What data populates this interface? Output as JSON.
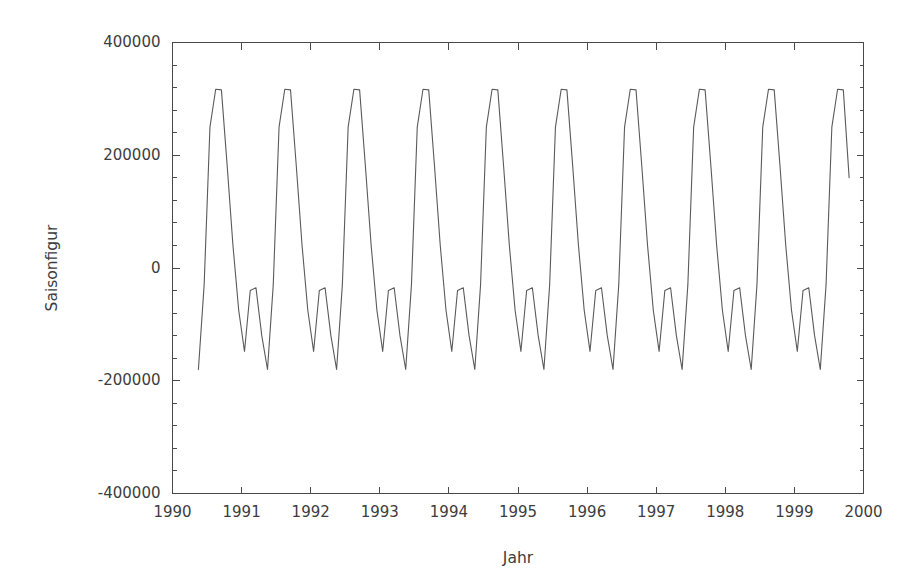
{
  "chart_data": {
    "type": "line",
    "title": "",
    "subtitle": "",
    "xlabel": "Jahr",
    "ylabel": "Saisonfigur",
    "xlim": [
      1990.0,
      2000.0
    ],
    "ylim": [
      -400000,
      400000
    ],
    "xticks": [
      1990,
      1991,
      1992,
      1993,
      1994,
      1995,
      1996,
      1997,
      1998,
      1999,
      2000
    ],
    "xtick_labels": [
      "1990",
      "1991",
      "1992",
      "1993",
      "1994",
      "1995",
      "1996",
      "1997",
      "1998",
      "1999",
      "2000"
    ],
    "yticks": [
      -400000,
      -200000,
      0,
      200000,
      400000
    ],
    "ytick_labels": [
      "-400000",
      "-200000",
      "0",
      "200000",
      "400000"
    ],
    "minor_ticks_per_interval_y": 4,
    "grid": false,
    "legend": null,
    "legend_position": "none",
    "line_color": "#5a5a5a",
    "axis_color": "#4a4a4a",
    "background_color": "#ffffff",
    "series": [
      {
        "name": "Saisonfigur",
        "x": [
          1990.375,
          1990.458,
          1990.542,
          1990.625,
          1990.708,
          1990.792,
          1990.875,
          1990.958,
          1991.042,
          1991.125,
          1991.208,
          1991.292,
          1991.375,
          1991.458,
          1991.542,
          1991.625,
          1991.708,
          1991.792,
          1991.875,
          1991.958,
          1992.042,
          1992.125,
          1992.208,
          1992.292,
          1992.375,
          1992.458,
          1992.542,
          1992.625,
          1992.708,
          1992.792,
          1992.875,
          1992.958,
          1993.042,
          1993.125,
          1993.208,
          1993.292,
          1993.375,
          1993.458,
          1993.542,
          1993.625,
          1993.708,
          1993.792,
          1993.875,
          1993.958,
          1994.042,
          1994.125,
          1994.208,
          1994.292,
          1994.375,
          1994.458,
          1994.542,
          1994.625,
          1994.708,
          1994.792,
          1994.875,
          1994.958,
          1995.042,
          1995.125,
          1995.208,
          1995.292,
          1995.375,
          1995.458,
          1995.542,
          1995.625,
          1995.708,
          1995.792,
          1995.875,
          1995.958,
          1996.042,
          1996.125,
          1996.208,
          1996.292,
          1996.375,
          1996.458,
          1996.542,
          1996.625,
          1996.708,
          1996.792,
          1996.875,
          1996.958,
          1997.042,
          1997.125,
          1997.208,
          1997.292,
          1997.375,
          1997.458,
          1997.542,
          1997.625,
          1997.708,
          1997.792,
          1997.875,
          1997.958,
          1998.042,
          1998.125,
          1998.208,
          1998.292,
          1998.375,
          1998.458,
          1998.542,
          1998.625,
          1998.708,
          1998.792,
          1998.875,
          1998.958,
          1999.042,
          1999.125,
          1999.208,
          1999.292,
          1999.375,
          1999.458,
          1999.542,
          1999.625,
          1999.708,
          1999.792
        ],
        "y": [
          -180000,
          -30000,
          250000,
          317000,
          316000,
          180000,
          40000,
          -75000,
          -148000,
          -40000,
          -35000,
          -120000,
          -180000,
          -30000,
          250000,
          317000,
          316000,
          180000,
          40000,
          -75000,
          -148000,
          -40000,
          -35000,
          -120000,
          -180000,
          -30000,
          250000,
          317000,
          316000,
          180000,
          40000,
          -75000,
          -148000,
          -40000,
          -35000,
          -120000,
          -180000,
          -30000,
          250000,
          317000,
          316000,
          180000,
          40000,
          -75000,
          -148000,
          -40000,
          -35000,
          -120000,
          -180000,
          -30000,
          250000,
          317000,
          316000,
          180000,
          40000,
          -75000,
          -148000,
          -40000,
          -35000,
          -120000,
          -180000,
          -30000,
          250000,
          317000,
          316000,
          180000,
          40000,
          -75000,
          -148000,
          -40000,
          -35000,
          -120000,
          -180000,
          -30000,
          250000,
          317000,
          316000,
          180000,
          40000,
          -75000,
          -148000,
          -40000,
          -35000,
          -120000,
          -180000,
          -30000,
          250000,
          317000,
          316000,
          180000,
          40000,
          -75000,
          -148000,
          -40000,
          -35000,
          -120000,
          -180000,
          -30000,
          250000,
          317000,
          316000,
          180000,
          40000,
          -75000,
          -148000,
          -40000,
          -35000,
          -120000,
          -180000,
          -30000,
          250000,
          317000,
          316000,
          160000
        ]
      }
    ],
    "annotations": []
  }
}
